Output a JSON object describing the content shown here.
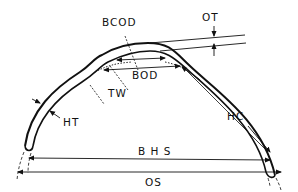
{
  "diagram": {
    "type": "cross-section measurement diagram (horseshoe/arch profile)",
    "labels": {
      "bcod": "BCOD",
      "ot": "OT",
      "bod": "BOD",
      "tw": "TW",
      "ht": "HT",
      "hc": "HC",
      "bhs": "B H S",
      "os": "OS"
    },
    "colors": {
      "stroke": "#111111",
      "background": "#ffffff"
    }
  }
}
